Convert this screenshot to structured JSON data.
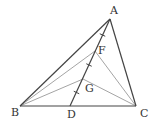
{
  "diagram": {
    "type": "geometry-triangle",
    "points": {
      "A": {
        "x": 110,
        "y": 19,
        "label": "A",
        "lx": 110,
        "ly": 14
      },
      "B": {
        "x": 20,
        "y": 106,
        "label": "B",
        "lx": 11,
        "ly": 116
      },
      "C": {
        "x": 136,
        "y": 106,
        "label": "C",
        "lx": 140,
        "ly": 117
      },
      "D": {
        "x": 70,
        "y": 106,
        "label": "D",
        "lx": 67,
        "ly": 118
      },
      "F": {
        "x": 95,
        "y": 51,
        "label": "F",
        "lx": 98,
        "ly": 54
      },
      "G": {
        "x": 83,
        "y": 79,
        "label": "G",
        "lx": 85,
        "ly": 92
      }
    },
    "dark_segments": [
      [
        "A",
        "B"
      ],
      [
        "A",
        "C"
      ],
      [
        "B",
        "C"
      ],
      [
        "A",
        "D"
      ]
    ],
    "light_segments": [
      [
        "B",
        "F"
      ],
      [
        "C",
        "F"
      ],
      [
        "B",
        "G"
      ],
      [
        "C",
        "G"
      ]
    ],
    "tick_marks_on_AD": 3,
    "colors": {
      "dark": "#444444",
      "light": "#9a9a9a"
    }
  }
}
